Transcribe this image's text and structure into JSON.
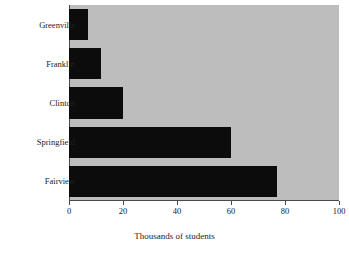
{
  "chart_data": {
    "type": "bar",
    "orientation": "horizontal",
    "title": "",
    "xlabel": "Thousands of students",
    "ylabel": "",
    "categories": [
      "Greenville",
      "Franklin",
      "Clinton",
      "Springfield",
      "Fairview"
    ],
    "values": [
      7,
      12,
      20,
      60,
      77
    ],
    "xlim": [
      0,
      100
    ],
    "xticks": [
      0,
      20,
      40,
      60,
      80,
      100
    ],
    "xtick_labels": [
      "0",
      "20",
      "40",
      "60",
      "80",
      "100"
    ],
    "grid": false,
    "legend": null,
    "series": [
      {
        "name": "Thousands of students",
        "values": [
          7,
          12,
          20,
          60,
          77
        ]
      }
    ],
    "colors": {
      "bar": "#0c0c0c",
      "plot_background": "#bdbdbd",
      "page_background": "#ffffff",
      "axis": "#4a4a4a",
      "text": "#222222"
    }
  }
}
